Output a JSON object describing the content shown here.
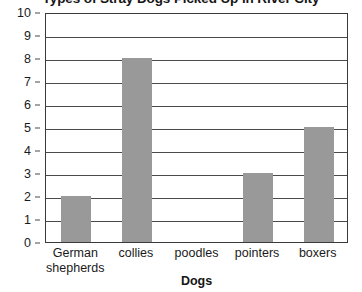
{
  "chart_data": {
    "type": "bar",
    "title": "Types of Stray Dogs Picked Up in River City",
    "xlabel": "Dogs",
    "ylabel": "",
    "categories": [
      "German shepherds",
      "collies",
      "poodles",
      "pointers",
      "boxers"
    ],
    "values": [
      2,
      8,
      0,
      3,
      5
    ],
    "ylim": [
      0,
      10
    ],
    "ytick_labels": [
      "10",
      "9",
      "8",
      "7",
      "6",
      "5",
      "4",
      "3",
      "2",
      "1",
      "0"
    ],
    "ytick_values": [
      10,
      9,
      8,
      7,
      6,
      5,
      4,
      3,
      2,
      1,
      0
    ],
    "grid": true,
    "legend": "none",
    "bar_color": "#999999",
    "axis_color": "#3a3a3a",
    "background_color": "#ffffff"
  },
  "axis": {
    "x_label_lines": [
      [
        "German",
        "shepherds"
      ],
      [
        "collies"
      ],
      [
        "poodles"
      ],
      [
        "pointers"
      ],
      [
        "boxers"
      ]
    ]
  }
}
